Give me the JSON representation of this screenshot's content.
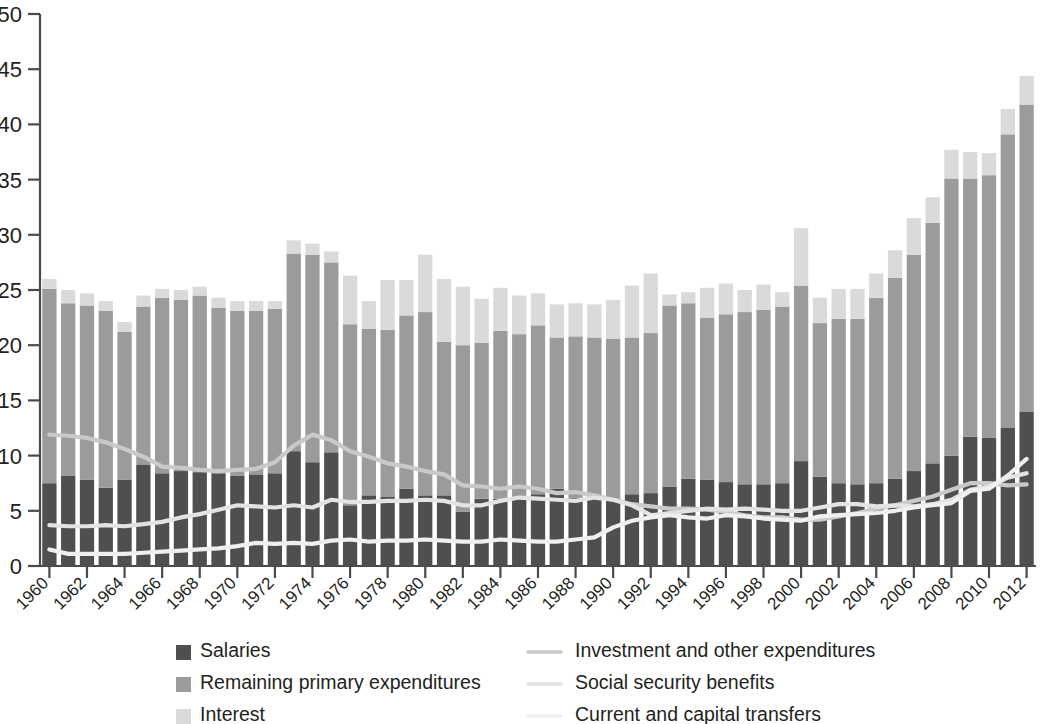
{
  "chart_data": {
    "type": "bar",
    "title": "",
    "subtitle": "",
    "xlabel": "",
    "ylabel": "",
    "ylim": [
      0,
      50
    ],
    "yticks": [
      0,
      5,
      10,
      15,
      20,
      25,
      30,
      35,
      40,
      45,
      50
    ],
    "grid": false,
    "legend_position": "bottom",
    "stacked": true,
    "x": [
      1960,
      1961,
      1962,
      1963,
      1964,
      1965,
      1966,
      1967,
      1968,
      1969,
      1970,
      1971,
      1972,
      1973,
      1974,
      1975,
      1976,
      1977,
      1978,
      1979,
      1980,
      1981,
      1982,
      1983,
      1984,
      1985,
      1986,
      1987,
      1988,
      1989,
      1990,
      1991,
      1992,
      1993,
      1994,
      1995,
      1996,
      1997,
      1998,
      1999,
      2000,
      2001,
      2002,
      2003,
      2004,
      2005,
      2006,
      2007,
      2008,
      2009,
      2010,
      2011,
      2012
    ],
    "xtick_labels": [
      "1960",
      "1962",
      "1964",
      "1966",
      "1968",
      "1970",
      "1972",
      "1974",
      "1976",
      "1978",
      "1980",
      "1982",
      "1984",
      "1986",
      "1988",
      "1990",
      "1992",
      "1994",
      "1996",
      "1998",
      "2000",
      "2002",
      "2004",
      "2006",
      "2008",
      "2010",
      "2012"
    ],
    "series": [
      {
        "name": "Salaries",
        "kind": "bar",
        "color": "#4f4f4f",
        "values": [
          7.5,
          8.2,
          7.8,
          7.1,
          7.8,
          9.2,
          8.4,
          8.6,
          8.5,
          8.4,
          8.2,
          8.3,
          8.4,
          10.4,
          9.4,
          10.3,
          5.5,
          6.4,
          6.3,
          7.0,
          6.4,
          6.4,
          4.9,
          6.1,
          6.1,
          6.2,
          6.5,
          7.0,
          6.2,
          6.2,
          6.1,
          6.5,
          6.6,
          7.2,
          7.9,
          7.8,
          7.6,
          7.4,
          7.4,
          7.5,
          9.5,
          8.1,
          7.5,
          7.4,
          7.5,
          7.9,
          8.6,
          9.3,
          10.0,
          11.7,
          11.6,
          12.5,
          14.0
        ]
      },
      {
        "name": "Remaining primary expenditures",
        "kind": "bar",
        "color": "#9b9b9b",
        "values": [
          17.6,
          15.6,
          15.8,
          16.0,
          13.4,
          14.3,
          15.9,
          15.5,
          16.0,
          15.0,
          14.9,
          14.8,
          14.9,
          17.9,
          18.8,
          17.2,
          16.4,
          15.1,
          15.1,
          15.7,
          16.6,
          13.9,
          15.1,
          14.1,
          15.2,
          14.8,
          15.3,
          13.7,
          14.6,
          14.5,
          14.5,
          14.2,
          14.5,
          16.4,
          15.9,
          14.7,
          15.2,
          15.6,
          15.8,
          16.0,
          15.9,
          13.9,
          14.9,
          15.0,
          16.8,
          18.2,
          19.6,
          21.8,
          25.1,
          23.4,
          23.8,
          26.6,
          27.8
        ]
      },
      {
        "name": "Interest",
        "kind": "bar",
        "color": "#dadada",
        "values": [
          0.9,
          1.2,
          1.1,
          0.9,
          0.9,
          1.0,
          0.8,
          0.9,
          0.8,
          0.9,
          0.9,
          0.9,
          0.7,
          1.2,
          1.0,
          1.0,
          4.4,
          2.5,
          4.5,
          3.2,
          5.2,
          5.7,
          5.3,
          4.0,
          3.9,
          3.5,
          2.9,
          3.0,
          3.0,
          3.0,
          3.5,
          4.7,
          5.4,
          1.0,
          1.0,
          2.7,
          2.8,
          2.0,
          2.3,
          1.3,
          5.2,
          2.3,
          2.7,
          2.7,
          2.2,
          2.5,
          3.3,
          2.3,
          2.6,
          2.4,
          2.0,
          2.3,
          2.6
        ]
      },
      {
        "name": "Investment and other expenditures",
        "kind": "line",
        "color": "#c9c9c9",
        "values": [
          11.9,
          11.8,
          11.6,
          11.2,
          10.6,
          9.9,
          9.0,
          8.9,
          8.7,
          8.6,
          8.7,
          8.8,
          9.4,
          10.9,
          11.9,
          11.4,
          10.4,
          9.9,
          9.3,
          9.0,
          8.6,
          8.3,
          7.3,
          7.2,
          7.0,
          7.2,
          7.0,
          6.6,
          6.7,
          6.4,
          6.0,
          5.6,
          5.4,
          5.2,
          5.2,
          5.1,
          4.9,
          4.6,
          4.4,
          4.4,
          4.2,
          4.2,
          4.5,
          4.8,
          5.2,
          5.5,
          5.9,
          6.3,
          6.9,
          7.5,
          7.5,
          7.3,
          7.4
        ]
      },
      {
        "name": "Social security benefits",
        "kind": "line",
        "color": "#e3e3e3",
        "values": [
          3.7,
          3.6,
          3.6,
          3.7,
          3.6,
          3.8,
          4.0,
          4.4,
          4.7,
          5.1,
          5.5,
          5.4,
          5.3,
          5.5,
          5.3,
          6.0,
          5.8,
          5.8,
          5.9,
          5.9,
          6.0,
          5.9,
          5.5,
          5.5,
          5.9,
          6.2,
          6.1,
          6.0,
          5.9,
          6.2,
          6.0,
          5.5,
          4.6,
          4.8,
          5.0,
          5.2,
          5.1,
          5.2,
          5.1,
          5.0,
          5.0,
          5.3,
          5.6,
          5.6,
          5.4,
          5.5,
          5.4,
          5.6,
          6.0,
          6.9,
          7.2,
          8.0,
          8.4
        ]
      },
      {
        "name": "Current and capital transfers",
        "kind": "line",
        "color": "#efefef",
        "values": [
          1.5,
          1.1,
          1.1,
          1.1,
          1.1,
          1.2,
          1.3,
          1.4,
          1.5,
          1.6,
          1.8,
          2.1,
          2.0,
          2.1,
          2.0,
          2.3,
          2.4,
          2.2,
          2.3,
          2.3,
          2.4,
          2.3,
          2.2,
          2.2,
          2.4,
          2.3,
          2.2,
          2.2,
          2.4,
          2.6,
          3.5,
          4.1,
          4.4,
          4.6,
          4.4,
          4.3,
          4.6,
          4.5,
          4.3,
          4.2,
          4.1,
          4.5,
          4.6,
          4.7,
          4.8,
          5.0,
          5.3,
          5.5,
          5.7,
          6.8,
          7.0,
          8.2,
          9.7
        ]
      }
    ],
    "colors": {
      "salaries": "#4f4f4f",
      "remaining_primary_expenditures": "#9b9b9b",
      "interest": "#dadada",
      "investment_and_other_expenditures": "#c9c9c9",
      "social_security_benefits": "#e3e3e3",
      "current_and_capital_transfers": "#efefef",
      "axis": "#4a4a4a",
      "text": "#231f20",
      "background": "#ffffff"
    }
  },
  "legend": {
    "left_column": [
      {
        "label": "Salaries",
        "swatch": "bar",
        "color": "#4f4f4f"
      },
      {
        "label": "Remaining primary expenditures",
        "swatch": "bar",
        "color": "#9b9b9b"
      },
      {
        "label": "Interest",
        "swatch": "bar",
        "color": "#dadada"
      }
    ],
    "right_column": [
      {
        "label": "Investment and other expenditures",
        "swatch": "line",
        "color": "#c9c9c9"
      },
      {
        "label": "Social security benefits",
        "swatch": "line",
        "color": "#e3e3e3"
      },
      {
        "label": "Current and capital transfers",
        "swatch": "line",
        "color": "#efefef"
      }
    ]
  }
}
